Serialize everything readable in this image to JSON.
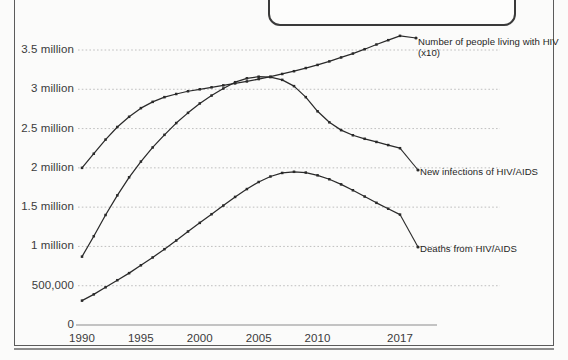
{
  "callout": {
    "text": "zant of risky behaviors that can expose you to HIV."
  },
  "chart_data": {
    "type": "line",
    "title": "",
    "subtitle": "",
    "xlabel": "",
    "ylabel": "",
    "grid": true,
    "legend_position": "right-inline",
    "x": [
      1990,
      1991,
      1992,
      1993,
      1994,
      1995,
      1996,
      1997,
      1998,
      1999,
      2000,
      2001,
      2002,
      2003,
      2004,
      2005,
      2006,
      2007,
      2008,
      2009,
      2010,
      2011,
      2012,
      2013,
      2014,
      2015,
      2016,
      2017
    ],
    "xlim": [
      1990,
      2017
    ],
    "ylim": [
      0,
      3750000
    ],
    "xticks": [
      1990,
      1995,
      2000,
      2005,
      2010,
      2017
    ],
    "xtick_labels": [
      "1990",
      "1995",
      "2000",
      "2005",
      "2010",
      "2017"
    ],
    "yticks": [
      0,
      500000,
      1000000,
      1500000,
      2000000,
      2500000,
      3000000,
      3500000
    ],
    "ytick_labels": [
      "0",
      "500,000",
      "1 million",
      "1.5 million",
      "2 million",
      "2.5 million",
      "3 million",
      "3.5 million"
    ],
    "series": [
      {
        "name": "Number of people living with HIV (x10)",
        "label": "Number of people living with HIV\n(x10)",
        "color": "#2a2a2a",
        "values": [
          2000000,
          2180000,
          2360000,
          2520000,
          2650000,
          2760000,
          2840000,
          2900000,
          2940000,
          2975000,
          3000000,
          3025000,
          3050000,
          3075000,
          3100000,
          3130000,
          3160000,
          3195000,
          3230000,
          3270000,
          3310000,
          3355000,
          3405000,
          3455000,
          3510000,
          3570000,
          3625000,
          3680000
        ]
      },
      {
        "name": "New infections of HIV/AIDS",
        "label": "New infections of HIV/AIDS",
        "color": "#2a2a2a",
        "values": [
          870000,
          1130000,
          1400000,
          1650000,
          1880000,
          2080000,
          2260000,
          2420000,
          2570000,
          2700000,
          2820000,
          2920000,
          3010000,
          3090000,
          3140000,
          3160000,
          3155000,
          3120000,
          3040000,
          2900000,
          2720000,
          2580000,
          2480000,
          2415000,
          2370000,
          2330000,
          2290000,
          2250000
        ]
      },
      {
        "name": "Deaths from HIV/AIDS",
        "label": "Deaths from HIV/AIDS",
        "color": "#2a2a2a",
        "values": [
          310000,
          390000,
          480000,
          570000,
          660000,
          760000,
          860000,
          965000,
          1075000,
          1190000,
          1300000,
          1410000,
          1520000,
          1630000,
          1730000,
          1820000,
          1890000,
          1935000,
          1950000,
          1940000,
          1905000,
          1855000,
          1790000,
          1715000,
          1635000,
          1555000,
          1480000,
          1405000
        ]
      }
    ],
    "series_label_anchor": [
      {
        "name": "Number of people living with HIV (x10)",
        "x": 418,
        "y": 36
      },
      {
        "name": "New infections of HIV/AIDS",
        "x": 420,
        "y": 166
      },
      {
        "name": "Deaths from HIV/AIDS",
        "x": 420,
        "y": 243
      }
    ]
  }
}
